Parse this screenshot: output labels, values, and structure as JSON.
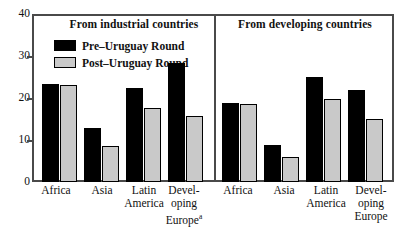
{
  "chart_data": {
    "type": "bar",
    "title": "",
    "xlabel": "",
    "ylabel": "",
    "ylim": [
      0,
      40
    ],
    "yticks": [
      0,
      10,
      20,
      30,
      40
    ],
    "grid": false,
    "legend_position": "top-left-inside",
    "legend": [
      "Pre–Uruguay Round",
      "Post–Uruguay Round"
    ],
    "series": [
      {
        "name": "Pre–Uruguay Round",
        "color": "#000000"
      },
      {
        "name": "Post–Uruguay Round",
        "color": "#c9c9c9"
      }
    ],
    "panels": [
      {
        "title": "From industrial countries",
        "categories": [
          "Africa",
          "Asia",
          "Latin America",
          "Developing Europe"
        ],
        "category_footnotes": [
          "",
          "",
          "",
          "a"
        ],
        "values_pre": [
          23.3,
          12.8,
          22.3,
          28.3
        ],
        "values_post": [
          23.0,
          8.5,
          17.7,
          15.6
        ]
      },
      {
        "title": "From developing countries",
        "categories": [
          "Africa",
          "Asia",
          "Latin America",
          "Developing Europe"
        ],
        "category_footnotes": [
          "",
          "",
          "",
          ""
        ],
        "values_pre": [
          18.8,
          8.9,
          25.1,
          21.8
        ],
        "values_post": [
          18.6,
          6.0,
          19.7,
          14.9
        ]
      }
    ]
  },
  "axis": {
    "tick_40": "40",
    "tick_30": "30",
    "tick_20": "20",
    "tick_10": "10",
    "tick_0": "0"
  },
  "panel_left": {
    "title": "From industrial countries",
    "legend_pre": "Pre–Uruguay Round",
    "legend_post": "Post–Uruguay Round",
    "cat_0": "Africa",
    "cat_1": "Asia",
    "cat_2_line1": "Latin",
    "cat_2_line2": "America",
    "cat_3_line1": "Devel-",
    "cat_3_line2": "oping",
    "cat_3_line3": "Europe",
    "cat_3_footnote": "a"
  },
  "panel_right": {
    "title": "From developing countries",
    "cat_0": "Africa",
    "cat_1": "Asia",
    "cat_2_line1": "Latin",
    "cat_2_line2": "America",
    "cat_3_line1": "Devel-",
    "cat_3_line2": "oping",
    "cat_3_line3": "Europe"
  },
  "colors": {
    "pre_bar": "#000000",
    "post_bar": "#c9c9c9",
    "axis": "#4a4a4a",
    "background": "#ffffff"
  }
}
